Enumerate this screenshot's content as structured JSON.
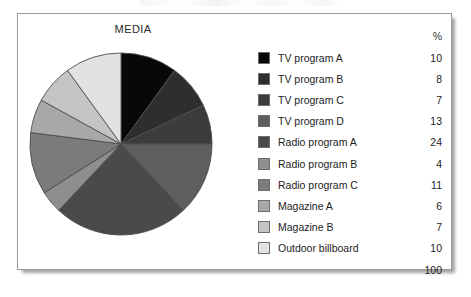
{
  "figure": {
    "title": "MEDIA",
    "percent_header": "%",
    "total": "100"
  },
  "chart_data": {
    "type": "pie",
    "title": "MEDIA",
    "ylabel": "",
    "xlabel": "",
    "units": "%",
    "start_angle_deg": 0,
    "direction": "clockwise",
    "legend_position": "right",
    "grid": false,
    "total": 100,
    "categories": [
      "TV program A",
      "TV program B",
      "TV program C",
      "TV program D",
      "Radio program A",
      "Radio program B",
      "Radio program C",
      "Magazine A",
      "Magazine B",
      "Outdoor billboard"
    ],
    "values": [
      10,
      8,
      7,
      13,
      24,
      4,
      11,
      6,
      7,
      10
    ],
    "colors": [
      "#080808",
      "#2e2e2e",
      "#3c3c3c",
      "#5e5e5e",
      "#4a4a4a",
      "#8e8e8e",
      "#7b7b7b",
      "#a8a8a8",
      "#c4c4c4",
      "#e2e2e2"
    ],
    "slice_border_color": "#4d4d4d"
  },
  "legend": {
    "rows": [
      {
        "label": "TV program A",
        "value": "10",
        "color": "#080808"
      },
      {
        "label": "TV program B",
        "value": "8",
        "color": "#2e2e2e"
      },
      {
        "label": "TV program C",
        "value": "7",
        "color": "#3c3c3c"
      },
      {
        "label": "TV program D",
        "value": "13",
        "color": "#5e5e5e"
      },
      {
        "label": "Radio program A",
        "value": "24",
        "color": "#4a4a4a"
      },
      {
        "label": "Radio program B",
        "value": "4",
        "color": "#8e8e8e"
      },
      {
        "label": "Radio program C",
        "value": "11",
        "color": "#7b7b7b"
      },
      {
        "label": "Magazine A",
        "value": "6",
        "color": "#a8a8a8"
      },
      {
        "label": "Magazine B",
        "value": "7",
        "color": "#c4c4c4"
      },
      {
        "label": "Outdoor billboard",
        "value": "10",
        "color": "#e2e2e2"
      }
    ]
  }
}
